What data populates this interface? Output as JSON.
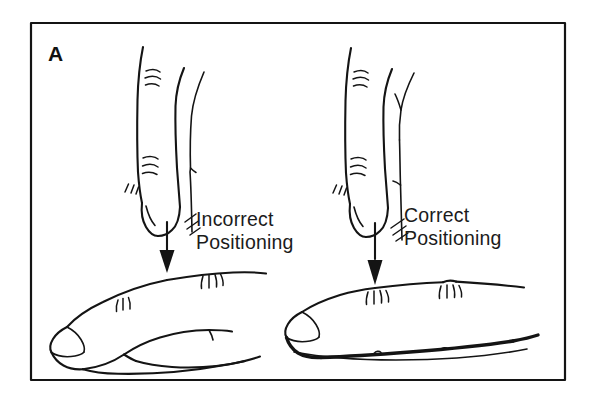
{
  "figure": {
    "panel_label": "A",
    "background_color": "#ffffff",
    "ink_color": "#141414",
    "frame": {
      "name": "figure-border",
      "x": 31,
      "y": 23,
      "width": 534,
      "height": 357
    },
    "illustrations": [
      {
        "id": "incorrect",
        "caption_line1": "Incorrect",
        "caption_line2": "Positioning",
        "caption_x": 196,
        "caption_y": 226,
        "arrow_label": "downward-pressure-arrow",
        "description": "Vertical examining finger contacting the dorsal surface of a horizontal finger away from the joint"
      },
      {
        "id": "correct",
        "caption_line1": "Correct",
        "caption_line2": "Positioning",
        "caption_x": 404,
        "caption_y": 222,
        "arrow_label": "downward-pressure-arrow",
        "description": "Vertical examining finger contacting the dorsal surface of a horizontal finger directly over the joint"
      }
    ]
  }
}
